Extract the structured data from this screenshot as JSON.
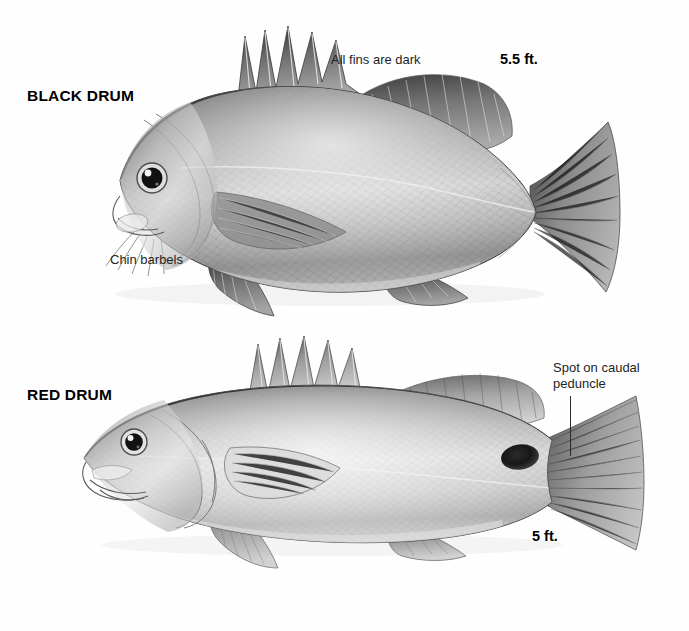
{
  "figure": {
    "kind": "comparative-fish-identification-plate",
    "background_color": "#fefefe",
    "ink_color": "#1a1a1a",
    "width": 689,
    "height": 631
  },
  "specimens": [
    {
      "id": "black-drum",
      "common_name": "BLACK DRUM",
      "max_size": "5.5 ft.",
      "annotations": [
        {
          "id": "fins-dark",
          "text": "All fins are dark",
          "leader": false
        },
        {
          "id": "chin-barbels",
          "text": "Chin barbels",
          "leader": false
        }
      ],
      "traits": {
        "body_shape": "deep, high-backed, arched",
        "snout": "blunt, rounded",
        "tail": "slightly forked",
        "fins": "dark",
        "barbels": "present on chin",
        "caudal_spot": "absent"
      }
    },
    {
      "id": "red-drum",
      "common_name": "RED DRUM",
      "max_size": "5 ft.",
      "annotations": [
        {
          "id": "caudal-spot",
          "text_line1": "Spot on caudal",
          "text_line2": "peduncle",
          "leader": true
        }
      ],
      "traits": {
        "body_shape": "elongate, streamlined",
        "snout": "pointed, conical",
        "tail": "squared / truncate",
        "fins": "pale",
        "barbels": "absent",
        "caudal_spot": "black ocellus on caudal peduncle"
      }
    }
  ],
  "colors": {
    "ink": "#1a1a1a",
    "body_dark": "#4a4a4a",
    "body_mid": "#9a9a9a",
    "body_light": "#dcdcdc",
    "highlight": "#f4f4f4",
    "spot": "#1c1c1c",
    "leader_line": "#2b2b2b"
  }
}
